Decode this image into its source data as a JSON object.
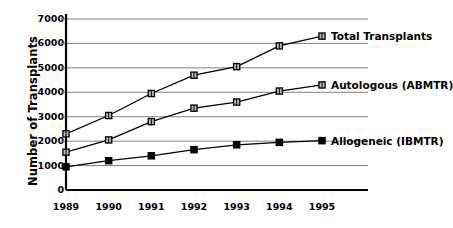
{
  "chart_data": {
    "type": "line",
    "title": "",
    "xlabel": "",
    "ylabel": "Number of Transplants",
    "categories": [
      "1989",
      "1990",
      "1991",
      "1992",
      "1993",
      "1994",
      "1995"
    ],
    "x": [
      1989,
      1990,
      1991,
      1992,
      1993,
      1994,
      1995
    ],
    "ylim": [
      0,
      7000
    ],
    "yticks": [
      0,
      1000,
      2000,
      3000,
      4000,
      5000,
      6000,
      7000
    ],
    "ytick_labels": [
      "0",
      "1000",
      "2000",
      "3000",
      "4000",
      "5000",
      "6000",
      "7000"
    ],
    "grid": "horizontal",
    "legend_position": "end-of-line",
    "series": [
      {
        "name": "Total Transplants",
        "marker": "open-square",
        "color": "#000000",
        "values": [
          2300,
          3050,
          3950,
          4700,
          5050,
          5900,
          6300
        ]
      },
      {
        "name": "Autologous (ABMTR)",
        "marker": "open-square",
        "color": "#000000",
        "values": [
          1550,
          2050,
          2800,
          3350,
          3600,
          4050,
          4300
        ]
      },
      {
        "name": "Allogeneic (IBMTR)",
        "marker": "filled-square",
        "color": "#000000",
        "values": [
          950,
          1200,
          1400,
          1650,
          1850,
          1950,
          2020
        ]
      }
    ]
  },
  "axis": {
    "line_color": "#000000",
    "grid_color": "#808080"
  }
}
